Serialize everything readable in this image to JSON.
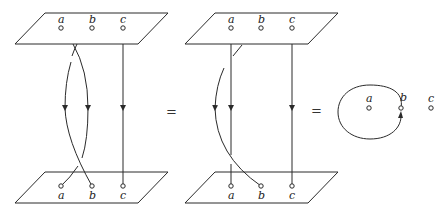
{
  "figure": {
    "panels": [
      {
        "id": "left",
        "top_plane_labels": [
          "a",
          "b",
          "c"
        ],
        "bottom_plane_labels": [
          "a",
          "b",
          "c"
        ],
        "description": "strands from a and b cross twice; strand c straight"
      },
      {
        "id": "middle",
        "top_plane_labels": [
          "a",
          "b",
          "c"
        ],
        "bottom_plane_labels": [
          "a",
          "b",
          "c"
        ],
        "description": "strand b loops around strand a; strands a and c straight"
      },
      {
        "id": "right",
        "point_labels": [
          "a",
          "b",
          "c"
        ],
        "description": "loop based at b encircling a, oriented counterclockwise"
      }
    ],
    "equals": [
      "=",
      "="
    ],
    "colors": {
      "ink": "#2a2a2a",
      "background": "#ffffff"
    }
  }
}
